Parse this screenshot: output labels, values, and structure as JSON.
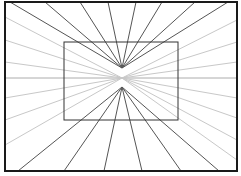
{
  "diagram": {
    "title": "",
    "type": "perspective-illusion",
    "canvas": {
      "width": 241,
      "height": 176,
      "background": "#ffffff"
    },
    "outer_frame": {
      "x1": 5,
      "y1": 2,
      "x2": 237,
      "y2": 171,
      "color": "#1a1a1a",
      "width": 2
    },
    "inner_rectangle": {
      "x1": 64,
      "y1": 42,
      "x2": 178,
      "y2": 120,
      "color": "#333333",
      "width": 1
    },
    "upper_apex": {
      "x": 122,
      "y": 68
    },
    "lower_apex": {
      "x": 122,
      "y": 87
    },
    "center": {
      "x": 122,
      "y": 78
    },
    "dark_ray_color": "#555555",
    "light_ray_color": "#c8c8c8",
    "upper_rays_top_x": [
      10,
      45,
      80,
      108,
      136,
      162,
      195,
      228
    ],
    "lower_rays_bottom_x": [
      18,
      64,
      104,
      142,
      181,
      219
    ],
    "left_gray_rays_y": [
      17,
      40,
      62,
      78,
      98,
      120,
      145
    ],
    "right_gray_rays_y": [
      20,
      42,
      62,
      78,
      98,
      118,
      140,
      160
    ]
  }
}
